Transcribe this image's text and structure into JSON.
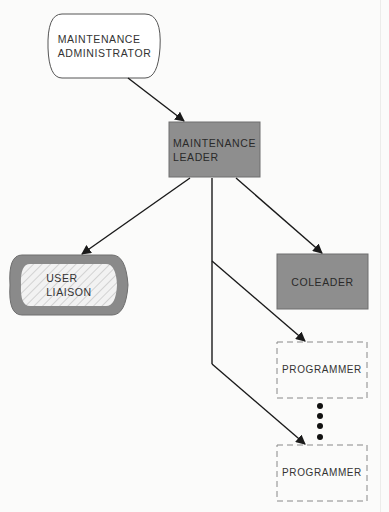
{
  "diagram": {
    "nodes": {
      "administrator": {
        "line1": "MAINTENANCE",
        "line2": "ADMINISTRATOR"
      },
      "leader": {
        "line1": "MAINTENANCE",
        "line2": "LEADER"
      },
      "liaison": {
        "line1": "USER",
        "line2": "LIAISON"
      },
      "coleader": {
        "label": "COLEADER"
      },
      "programmer1": {
        "label": "PROGRAMMER"
      },
      "programmer2": {
        "label": "PROGRAMMER"
      }
    },
    "edges": [
      {
        "from": "administrator",
        "to": "leader"
      },
      {
        "from": "leader",
        "to": "liaison"
      },
      {
        "from": "leader",
        "to": "coleader"
      },
      {
        "from": "leader",
        "to": "programmer1"
      },
      {
        "from": "leader",
        "to": "programmer2"
      }
    ],
    "ellipsis": "more programmers",
    "colors": {
      "leader_fill": "#8e8e8e",
      "coleader_fill": "#8e8e8e",
      "liaison_border": "#8a8a8a",
      "line": "#1a1a1a",
      "dashed": "#888888"
    }
  }
}
